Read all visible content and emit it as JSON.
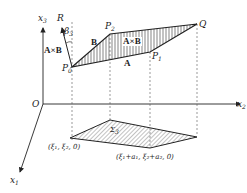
{
  "figure": {
    "axes": {
      "x1": {
        "label": "x",
        "sub": "1"
      },
      "x2": {
        "label": "x",
        "sub": "2"
      },
      "x3": {
        "label": "x",
        "sub": "3"
      },
      "origin": "O"
    },
    "points": {
      "P0": {
        "label": "P",
        "sub": "0"
      },
      "P1": {
        "label": "P",
        "sub": "1"
      },
      "P2": {
        "label": "P",
        "sub": "2"
      },
      "Q": {
        "label": "Q"
      },
      "R": {
        "label": "R"
      }
    },
    "angle": {
      "label": "β",
      "sub": "3"
    },
    "vectors": {
      "A": "A",
      "B": "B",
      "AxB_left": "A×B",
      "AxB_center": "A×B"
    },
    "projection": {
      "region_label": "Σ",
      "region_sub": "3",
      "corner1": "(ξ₁, ξ₂, 0)",
      "corner2": "(ξ₁+a₁, ξ₂+a₂, 0)"
    },
    "colors": {
      "line": "#222222",
      "dashed": "#555555",
      "background": "#ffffff"
    }
  }
}
